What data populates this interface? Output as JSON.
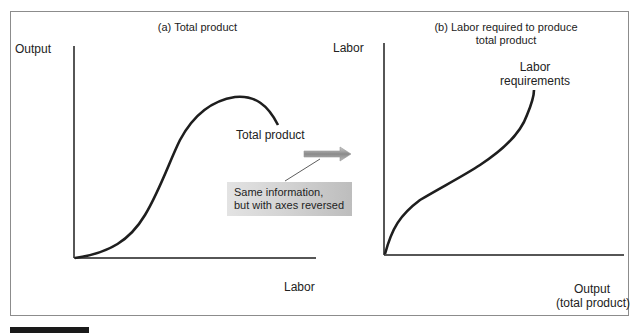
{
  "chart_data": [
    {
      "type": "line",
      "title": "(a) Total product",
      "xlabel": "Labor",
      "ylabel": "Output",
      "series": [
        {
          "name": "Total product",
          "shape": "S-shaped rising curve that peaks then declines",
          "x": [
            0,
            1,
            2,
            3,
            4,
            5,
            6,
            7,
            8
          ],
          "y": [
            0,
            0.4,
            1.2,
            3.0,
            5.2,
            6.6,
            7.0,
            6.8,
            5.5
          ]
        }
      ],
      "grid": false,
      "ticks": "none"
    },
    {
      "type": "line",
      "title": "(b) Labor required to produce total product",
      "xlabel": "Output (total product)",
      "ylabel": "Labor",
      "series": [
        {
          "name": "Labor requirements",
          "shape": "concave then convex rising curve (inverse of total product)",
          "x": [
            0,
            1,
            2,
            3,
            4,
            5,
            6,
            6.8,
            7.0
          ],
          "y": [
            0,
            2.5,
            3.4,
            4.0,
            4.6,
            5.3,
            6.0,
            7.0,
            8.0
          ]
        }
      ],
      "grid": false,
      "ticks": "none"
    }
  ],
  "panel_a": {
    "title": "(a) Total product",
    "y_axis_label": "Output",
    "x_axis_label": "Labor",
    "curve_label": "Total product"
  },
  "panel_b": {
    "title_line1": "(b) Labor required to produce",
    "title_line2": "total product",
    "y_axis_label": "Labor",
    "x_axis_label_line1": "Output",
    "x_axis_label_line2": "(total product)",
    "curve_label_line1": "Labor",
    "curve_label_line2": "requirements"
  },
  "callout": {
    "line1": "Same information,",
    "line2": "but with axes reversed"
  },
  "colors": {
    "curve": "#1e1e1e",
    "axis": "#1e1e1e",
    "frame": "#8c8c8c",
    "callout_bg_light": "#e3e3e3",
    "callout_bg_dark": "#bdbdbd",
    "arrow": "#9a9a9a"
  }
}
